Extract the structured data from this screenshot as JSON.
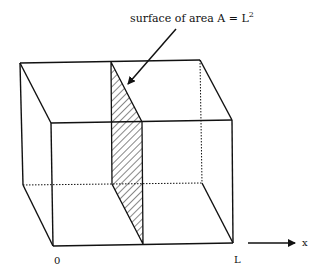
{
  "diagram": {
    "annotation": {
      "text": "surface of area A = L",
      "superscript": "2"
    },
    "labels": {
      "origin": "0",
      "length": "L",
      "axis": "x"
    },
    "colors": {
      "line": "#111111",
      "background": "#ffffff"
    }
  }
}
